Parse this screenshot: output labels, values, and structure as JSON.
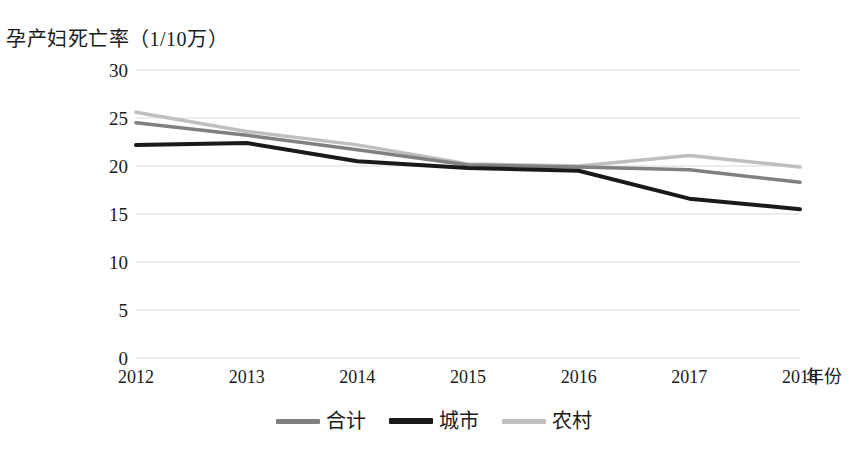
{
  "chart_data": {
    "type": "line",
    "title": "孕产妇死亡率（1/10万）",
    "ylabel": "孕产妇死亡率（1/10万）",
    "xlabel": "年份",
    "categories": [
      "2012",
      "2013",
      "2014",
      "2015",
      "2016",
      "2017",
      "2018"
    ],
    "x": [
      2012,
      2013,
      2014,
      2015,
      2016,
      2017,
      2018
    ],
    "ylim": [
      0,
      30
    ],
    "ytick_labels": [
      "0",
      "5",
      "10",
      "15",
      "20",
      "25",
      "30"
    ],
    "ytick_values": [
      0,
      5,
      10,
      15,
      20,
      25,
      30
    ],
    "grid": true,
    "grid_axis": "y",
    "legend_position": "bottom",
    "series": [
      {
        "name": "合计",
        "color": "#808080",
        "values": [
          24.5,
          23.2,
          21.7,
          20.1,
          19.9,
          19.6,
          18.3
        ]
      },
      {
        "name": "城市",
        "color": "#1a1a1a",
        "values": [
          22.2,
          22.4,
          20.5,
          19.8,
          19.5,
          16.6,
          15.5
        ]
      },
      {
        "name": "农村",
        "color": "#bfbfbf",
        "values": [
          25.6,
          23.6,
          22.2,
          20.2,
          20.0,
          21.1,
          19.9
        ]
      }
    ]
  },
  "colors": {
    "total_line": "#808080",
    "urban_line": "#1a1a1a",
    "rural_line": "#bfbfbf",
    "gridline": "#d9d9d9",
    "text": "#1a1a1a",
    "background": "#ffffff"
  }
}
